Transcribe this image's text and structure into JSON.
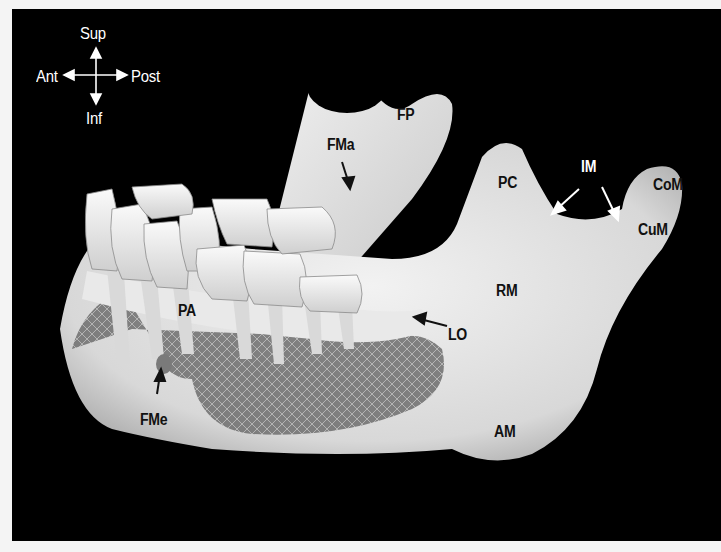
{
  "figure": {
    "orientation": {
      "superior": "Sup",
      "inferior": "Inf",
      "anterior": "Ant",
      "posterior": "Post"
    },
    "labels": {
      "fp": "FP",
      "fma": "FMa",
      "pc": "PC",
      "im": "IM",
      "com": "CoM",
      "cum": "CuM",
      "rm": "RM",
      "pa": "PA",
      "lo": "LO",
      "fme": "FMe",
      "am": "AM"
    },
    "colors": {
      "background": "#000000",
      "page": "#f4f4f4",
      "bone": "#e6e6e6",
      "label_dark": "#111111",
      "label_light": "#ffffff"
    }
  }
}
